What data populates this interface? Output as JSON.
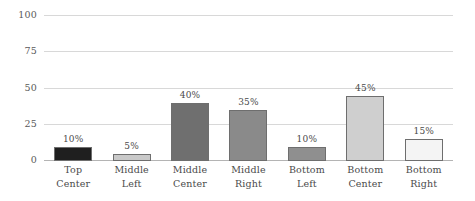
{
  "chart_data": {
    "type": "bar",
    "title": "",
    "subtitle": "",
    "xlabel": "",
    "ylabel": "",
    "ylim": [
      0,
      100
    ],
    "yticks": [
      0,
      25,
      50,
      75,
      100
    ],
    "ytick_labels": [
      "0",
      "25",
      "50",
      "75",
      "100"
    ],
    "grid": true,
    "legend": false,
    "legend_position": "none",
    "orientation": "vertical",
    "categories": [
      "Top Center",
      "Middle Left",
      "Middle Center",
      "Middle Right",
      "Bottom Left",
      "Bottom Center",
      "Bottom Right"
    ],
    "category_lines": [
      [
        "Top",
        "Center"
      ],
      [
        "Middle",
        "Left"
      ],
      [
        "Middle",
        "Center"
      ],
      [
        "Middle",
        "Right"
      ],
      [
        "Bottom",
        "Left"
      ],
      [
        "Bottom",
        "Center"
      ],
      [
        "Bottom",
        "Right"
      ]
    ],
    "values": [
      10,
      5,
      40,
      35,
      10,
      45,
      15
    ],
    "data_labels": [
      "10%",
      "5%",
      "40%",
      "35%",
      "10%",
      "45%",
      "15%"
    ],
    "bar_colors": [
      "#1f1f1f",
      "#c9c9c9",
      "#6f6f6f",
      "#8a8a8a",
      "#8f8f8f",
      "#cfcfcf",
      "#f4f4f4"
    ],
    "bar_border_color": "#6e6e6e",
    "grid_color": "#d8d8d8",
    "axis_color": "#b4b4b4",
    "text_color": "#4a4a4a",
    "background_color": "#ffffff"
  }
}
